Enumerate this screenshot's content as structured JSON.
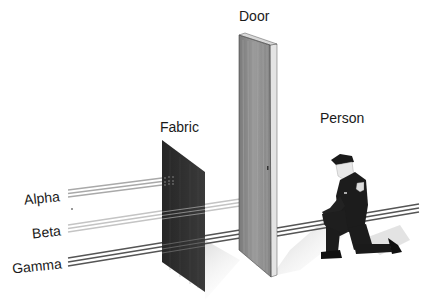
{
  "diagram": {
    "type": "radiation-penetration",
    "radiation_types": [
      {
        "name": "Alpha",
        "color": "#a9a9a9",
        "stops_at": "Fabric"
      },
      {
        "name": "Beta",
        "color": "#c4c4c4",
        "stops_at": "Door"
      },
      {
        "name": "Gamma",
        "color": "#555555",
        "stops_at": "none"
      }
    ],
    "barriers": [
      {
        "name": "Fabric",
        "color": "#2e2e2e"
      },
      {
        "name": "Door",
        "color": "#8a8a8a"
      },
      {
        "name": "Person",
        "color": "#1c1c1c"
      }
    ]
  },
  "labels": {
    "alpha": "Alpha",
    "beta": "Beta",
    "gamma": "Gamma",
    "fabric": "Fabric",
    "door": "Door",
    "person": "Person"
  }
}
